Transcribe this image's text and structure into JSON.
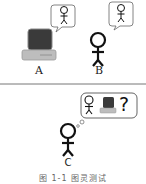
{
  "diagram": {
    "top_panel": {
      "participants": [
        {
          "id": "A",
          "label": "A",
          "type": "computer"
        },
        {
          "id": "B",
          "label": "B",
          "type": "human"
        }
      ]
    },
    "bottom_panel": {
      "participants": [
        {
          "id": "C",
          "label": "C",
          "type": "human-interrogator",
          "thought": "?"
        }
      ]
    },
    "caption": "图 1-1   图灵测试",
    "colors": {
      "stroke": "#111111",
      "screen": "#3a3a3a",
      "computer_body": "#bdbdbd",
      "divider": "#777777",
      "bubble_border": "#555555"
    }
  }
}
